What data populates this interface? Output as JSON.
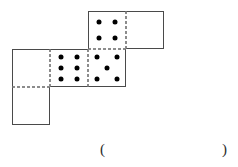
{
  "figure": {
    "name": "dice-net",
    "grid": {
      "origin_x": 12,
      "origin_y": 11,
      "cell_size": 38,
      "columns": 4,
      "rows": 3
    },
    "style": {
      "solid_edge_color": "#4a4a4a",
      "dashed_edge_color": "#8c8c8c",
      "pip_color": "#000000",
      "face_fill": "#ffffff",
      "solid_edge_width": 1,
      "dashed_edge_width": 1
    },
    "cells": [
      {
        "id": "cell-r0c2",
        "name": "net-face-four",
        "row": 0,
        "col": 2,
        "pip_count": 4,
        "pips": [
          {
            "cx": 30,
            "cy": 30
          },
          {
            "cx": 70,
            "cy": 30
          },
          {
            "cx": 30,
            "cy": 70
          },
          {
            "cx": 70,
            "cy": 70
          }
        ],
        "edges": {
          "top": "solid",
          "right": "dashed",
          "bottom": "dashed",
          "left": "solid"
        }
      },
      {
        "id": "cell-r0c3",
        "name": "net-face-blank-top-right",
        "row": 0,
        "col": 3,
        "pip_count": 0,
        "pips": [],
        "edges": {
          "top": "solid",
          "right": "solid",
          "bottom": "solid",
          "left": "dashed"
        }
      },
      {
        "id": "cell-r1c0",
        "name": "net-face-blank-middle-left",
        "row": 1,
        "col": 0,
        "pip_count": 0,
        "pips": [],
        "edges": {
          "top": "solid",
          "right": "dashed",
          "bottom": "dashed",
          "left": "solid"
        }
      },
      {
        "id": "cell-r1c1",
        "name": "net-face-six",
        "row": 1,
        "col": 1,
        "pip_count": 6,
        "pips": [
          {
            "cx": 30,
            "cy": 22
          },
          {
            "cx": 70,
            "cy": 22
          },
          {
            "cx": 30,
            "cy": 50
          },
          {
            "cx": 70,
            "cy": 50
          },
          {
            "cx": 30,
            "cy": 78
          },
          {
            "cx": 70,
            "cy": 78
          }
        ],
        "edges": {
          "top": "solid",
          "right": "dashed",
          "bottom": "solid",
          "left": "dashed"
        }
      },
      {
        "id": "cell-r1c2",
        "name": "net-face-five",
        "row": 1,
        "col": 2,
        "pip_count": 5,
        "pips": [
          {
            "cx": 24,
            "cy": 22
          },
          {
            "cx": 76,
            "cy": 22
          },
          {
            "cx": 50,
            "cy": 50
          },
          {
            "cx": 24,
            "cy": 78
          },
          {
            "cx": 76,
            "cy": 78
          }
        ],
        "edges": {
          "top": "dashed",
          "right": "solid",
          "bottom": "solid",
          "left": "dashed"
        }
      },
      {
        "id": "cell-r2c0",
        "name": "net-face-blank-bottom-left",
        "row": 2,
        "col": 0,
        "pip_count": 0,
        "pips": [],
        "edges": {
          "top": "dashed",
          "right": "solid",
          "bottom": "solid",
          "left": "solid"
        }
      }
    ]
  },
  "answer": {
    "open_paren": "(",
    "close_paren": ")",
    "blank_value": ""
  }
}
